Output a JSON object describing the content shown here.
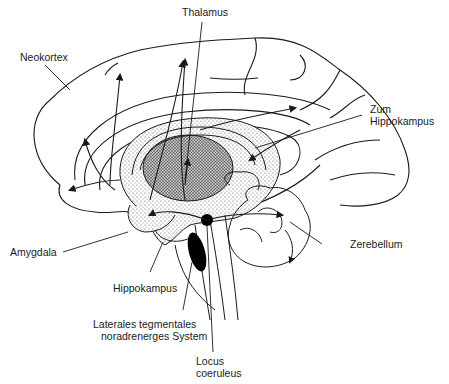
{
  "diagram": {
    "type": "anatomical-brain-sagittal-section",
    "labels": {
      "thalamus": "Thalamus",
      "neokortex": "Neokortex",
      "zum_hippokampus_1": "Zum",
      "zum_hippokampus_2": "Hippokampus",
      "amygdala": "Amygdala",
      "zerebellum": "Zerebellum",
      "hippokampus": "Hippokampus",
      "lateral_1": "Laterales tegmentales",
      "lateral_2": "noradrenerges System",
      "locus_1": "Locus",
      "locus_2": "coeruleus"
    },
    "colors": {
      "line": "#1a1a1a",
      "stipple_light": "#d9d9d9",
      "stipple_dark": "#9a9a9a",
      "nucleus": "#000000",
      "background": "#ffffff"
    }
  }
}
